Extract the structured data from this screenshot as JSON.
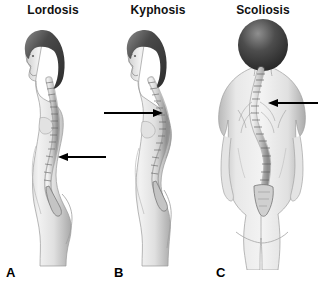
{
  "image": {
    "type": "medical-illustration",
    "subject": "Abnormal curvatures of the vertebral column",
    "background_color": "#ffffff",
    "width": 318,
    "height": 288
  },
  "panels": [
    {
      "letter": "A",
      "title": "Lordosis",
      "view": "lateral-left-profile",
      "arrow": {
        "direction": "left",
        "points_at": "exaggerated lumbar inward curve",
        "color": "#000000"
      }
    },
    {
      "letter": "B",
      "title": "Kyphosis",
      "view": "lateral-left-profile",
      "arrow": {
        "direction": "right",
        "points_at": "exaggerated thoracic outward curve",
        "color": "#000000"
      }
    },
    {
      "letter": "C",
      "title": "Scoliosis",
      "view": "posterior",
      "arrow": {
        "direction": "left",
        "points_at": "lateral S-shaped curve of the spine",
        "color": "#000000"
      }
    }
  ],
  "palette": {
    "hair_dark": "#3a3a3a",
    "hair_mid": "#6d6d6d",
    "skin_light": "#efefef",
    "skin_mid": "#d2d2d2",
    "skin_shadow": "#a8a8a8",
    "outline": "#6b6b6b",
    "bone_light": "#e6e6e6",
    "bone_mid": "#bdbdbd",
    "bone_dark": "#8a8a8a",
    "arrow": "#000000",
    "text": "#111111"
  }
}
